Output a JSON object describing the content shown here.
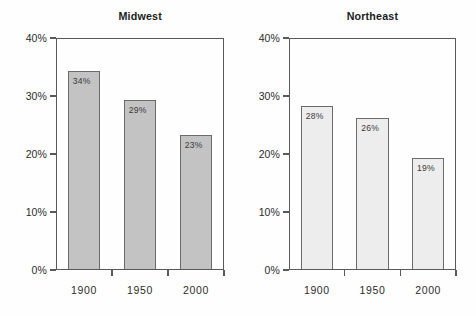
{
  "chart_data": [
    {
      "type": "bar",
      "title": "Midwest",
      "categories": [
        "1900",
        "1950",
        "2000"
      ],
      "values": [
        34,
        29,
        23
      ],
      "value_labels": [
        "34%",
        "29%",
        "23%"
      ],
      "xlabel": "",
      "ylabel": "",
      "ylim": [
        0,
        40
      ],
      "ytick_values": [
        0,
        10,
        20,
        30,
        40
      ],
      "ytick_labels": [
        "0%",
        "10%",
        "20%",
        "30%",
        "40%"
      ],
      "grid": false,
      "legend": false,
      "bar_fill": "#c3c3c3",
      "bar_border": "#6b6b6b"
    },
    {
      "type": "bar",
      "title": "Northeast",
      "categories": [
        "1900",
        "1950",
        "2000"
      ],
      "values": [
        28,
        26,
        19
      ],
      "value_labels": [
        "28%",
        "26%",
        "19%"
      ],
      "xlabel": "",
      "ylabel": "",
      "ylim": [
        0,
        40
      ],
      "ytick_values": [
        0,
        10,
        20,
        30,
        40
      ],
      "ytick_labels": [
        "0%",
        "10%",
        "20%",
        "30%",
        "40%"
      ],
      "grid": false,
      "legend": false,
      "bar_fill": "#ededed",
      "bar_border": "#6b6b6b"
    }
  ]
}
